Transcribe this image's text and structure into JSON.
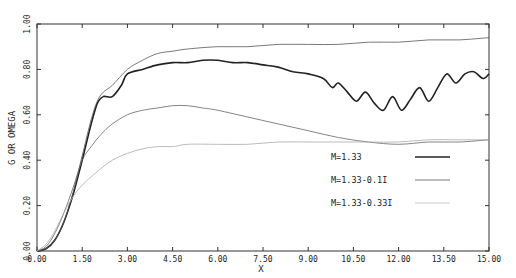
{
  "chart_data": {
    "type": "line",
    "title": "",
    "xlabel": "X",
    "ylabel": "G OR OMEGA",
    "xlim": [
      0,
      15
    ],
    "ylim": [
      0,
      1
    ],
    "grid": false,
    "legend_position": "lower right (inside plot)",
    "x_ticks": [
      "0.00",
      "1.50",
      "3.00",
      "4.50",
      "6.00",
      "7.50",
      "9.00",
      "10.50",
      "12.00",
      "13.50",
      "15.00"
    ],
    "y_ticks": [
      "0.00",
      "0.20",
      "0.40",
      "0.60",
      "0.80",
      "1.00"
    ],
    "series": [
      {
        "name": "M=1.33",
        "style": "thick solid",
        "color": "#222222",
        "x": [
          0,
          0.3,
          0.6,
          0.9,
          1.2,
          1.5,
          1.8,
          2.0,
          2.2,
          2.5,
          2.8,
          3.0,
          3.5,
          4.0,
          4.5,
          5.0,
          5.5,
          6.0,
          6.5,
          7.0,
          7.5,
          8.0,
          8.5,
          9.0,
          9.5,
          9.8,
          10.0,
          10.3,
          10.6,
          10.9,
          11.2,
          11.5,
          11.8,
          12.1,
          12.4,
          12.7,
          13.0,
          13.3,
          13.6,
          13.9,
          14.2,
          14.5,
          14.8,
          15.0
        ],
        "y": [
          0,
          0.01,
          0.05,
          0.13,
          0.25,
          0.4,
          0.56,
          0.65,
          0.68,
          0.68,
          0.73,
          0.78,
          0.8,
          0.82,
          0.83,
          0.83,
          0.84,
          0.84,
          0.83,
          0.83,
          0.82,
          0.81,
          0.79,
          0.78,
          0.76,
          0.72,
          0.74,
          0.7,
          0.66,
          0.7,
          0.65,
          0.62,
          0.68,
          0.62,
          0.67,
          0.72,
          0.66,
          0.72,
          0.78,
          0.74,
          0.78,
          0.79,
          0.76,
          0.78
        ]
      },
      {
        "name": "M=1.33-0.1I",
        "style": "thin solid",
        "color": "#555555",
        "x": [
          0,
          0.3,
          0.6,
          0.9,
          1.2,
          1.5,
          1.8,
          2.0,
          2.2,
          2.5,
          3.0,
          3.5,
          4.0,
          4.5,
          5.0,
          6.0,
          7.0,
          8.0,
          9.0,
          10.0,
          11.0,
          12.0,
          13.0,
          14.0,
          15.0
        ],
        "y": [
          0,
          0.01,
          0.05,
          0.13,
          0.26,
          0.42,
          0.58,
          0.66,
          0.7,
          0.73,
          0.8,
          0.84,
          0.87,
          0.88,
          0.89,
          0.9,
          0.9,
          0.91,
          0.91,
          0.91,
          0.92,
          0.92,
          0.93,
          0.93,
          0.94
        ]
      },
      {
        "name": "M=1.33-0.1I (lower)",
        "style": "thin solid",
        "color": "#666666",
        "x": [
          0,
          0.3,
          0.6,
          0.9,
          1.2,
          1.5,
          1.8,
          2.1,
          2.5,
          3.0,
          3.5,
          4.0,
          4.5,
          5.0,
          5.5,
          6.0,
          7.0,
          8.0,
          9.0,
          10.0,
          11.0,
          12.0,
          13.0,
          14.0,
          15.0
        ],
        "y": [
          0,
          0.02,
          0.08,
          0.17,
          0.28,
          0.4,
          0.46,
          0.51,
          0.56,
          0.6,
          0.62,
          0.63,
          0.64,
          0.64,
          0.63,
          0.62,
          0.59,
          0.56,
          0.53,
          0.5,
          0.48,
          0.47,
          0.48,
          0.48,
          0.49
        ]
      },
      {
        "name": "M=1.33-0.33I",
        "style": "thin light solid",
        "color": "#aaaaaa",
        "x": [
          0,
          0.3,
          0.6,
          0.9,
          1.2,
          1.5,
          2.0,
          2.5,
          3.0,
          3.5,
          4.0,
          4.5,
          5.0,
          6.0,
          7.0,
          8.0,
          9.0,
          10.0,
          11.0,
          12.0,
          13.0,
          14.0,
          15.0
        ],
        "y": [
          0,
          0.03,
          0.09,
          0.17,
          0.24,
          0.29,
          0.35,
          0.4,
          0.43,
          0.45,
          0.46,
          0.46,
          0.47,
          0.47,
          0.47,
          0.48,
          0.48,
          0.48,
          0.48,
          0.48,
          0.49,
          0.49,
          0.49
        ]
      }
    ],
    "legend": [
      {
        "label": "M=1.33",
        "style": "thick"
      },
      {
        "label": "M=1.33-0.1I",
        "style": "thin"
      },
      {
        "label": "M=1.33-0.33I",
        "style": "light"
      }
    ]
  }
}
